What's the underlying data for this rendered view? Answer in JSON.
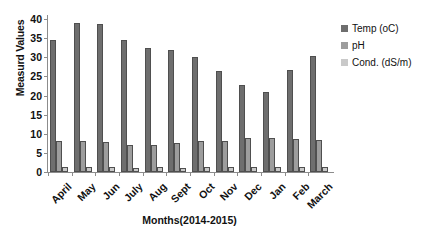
{
  "chart_data": {
    "type": "bar",
    "title": "",
    "xlabel": "Months(2014-2015)",
    "ylabel": "Measurd Values",
    "ylim": [
      0,
      40
    ],
    "ytick_labels": [
      "40",
      "35",
      "30",
      "25",
      "20",
      "15",
      "10",
      "5",
      "0"
    ],
    "ytick_values": [
      40,
      35,
      30,
      25,
      20,
      15,
      10,
      5,
      0
    ],
    "grid": false,
    "legend_position": "right",
    "categories": [
      "April",
      "May",
      "Jun",
      "July",
      "Aug",
      "Sept",
      "Oct",
      "Nov",
      "Dec",
      "Jan",
      "Feb",
      "March"
    ],
    "series": [
      {
        "name": "Temp (oC)",
        "color": "#6e6e6e",
        "values": [
          34.5,
          39.0,
          38.7,
          34.5,
          32.5,
          31.8,
          30.1,
          26.3,
          22.7,
          21.0,
          26.7,
          30.3
        ]
      },
      {
        "name": "pH",
        "color": "#9d9d9d",
        "values": [
          8.1,
          8.0,
          7.8,
          7.1,
          7.0,
          7.5,
          8.0,
          8.1,
          9.0,
          9.0,
          8.7,
          8.5
        ]
      },
      {
        "name": "Cond. (dS/m)",
        "color": "#c9c9c9",
        "values": [
          1.2,
          1.2,
          1.2,
          1.1,
          1.2,
          1.1,
          1.2,
          1.4,
          1.4,
          1.3,
          1.2,
          1.3
        ]
      }
    ]
  }
}
